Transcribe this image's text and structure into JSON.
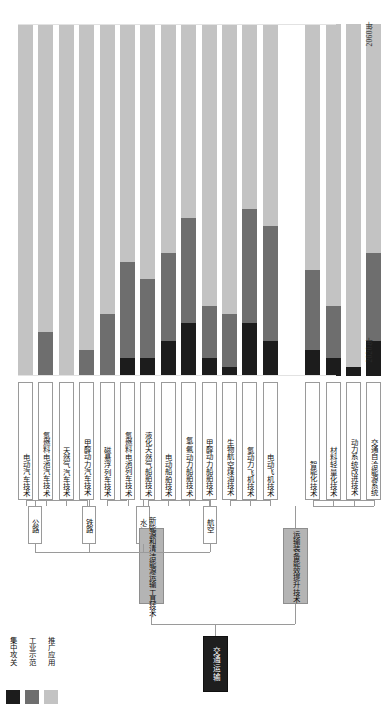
{
  "figure": {
    "years": {
      "top": "2060年",
      "bottom": "2020年"
    }
  },
  "legend": {
    "items": [
      {
        "label": "集中攻关",
        "color": "#1c1c1c"
      },
      {
        "label": "工业示范",
        "color": "#6e6e6e"
      },
      {
        "label": "推广应用",
        "color": "#c3c3c3"
      }
    ]
  },
  "hierarchy": {
    "root": {
      "label": "交通运输"
    },
    "groups": [
      {
        "label": "新能源和清洁能源运输工具技术"
      },
      {
        "label": "运输装备能效提升技术"
      }
    ],
    "categories": [
      {
        "label": "公路"
      },
      {
        "label": "铁路"
      },
      {
        "label": "水运"
      },
      {
        "label": "航空"
      }
    ]
  },
  "chart_data": {
    "type": "bar",
    "orientation": "vertical-stacked",
    "title": "",
    "xlabel": "",
    "ylabel": "",
    "ylim": [
      2020,
      2060
    ],
    "grid": false,
    "legend_position": "bottom-left",
    "series": [
      {
        "name": "集中攻关",
        "color": "#1c1c1c"
      },
      {
        "name": "工业示范",
        "color": "#6e6e6e"
      },
      {
        "name": "推广应用",
        "color": "#c3c3c3"
      }
    ],
    "categories": [
      "电动汽车技术",
      "氢燃料电池汽车技术",
      "天然气汽车技术",
      "甲醇动力汽车技术",
      "磁悬浮列车技术",
      "氢燃料电池列车技术",
      "液化天然气船舶技术",
      "电动船舶技术",
      "氢/氨动力船舶技术",
      "甲醇动力船舶技术",
      "生物航空煤油技术",
      "氢动力飞机技术",
      "电动飞机技术",
      "智能化技术",
      "材料轻量化技术",
      "动力系统改进技术",
      "交通自洽能源系统"
    ],
    "bars": [
      {
        "label": "电动汽车技术",
        "group": "公路",
        "focus_end": 2020,
        "demo_end": 2020,
        "deploy_end": 2060
      },
      {
        "label": "氢燃料电池汽车技术",
        "group": "公路",
        "focus_end": 2020,
        "demo_end": 2025,
        "deploy_end": 2060
      },
      {
        "label": "天然气汽车技术",
        "group": "公路",
        "focus_end": 2020,
        "demo_end": 2020,
        "deploy_end": 2060
      },
      {
        "label": "甲醇动力汽车技术",
        "group": "公路",
        "focus_end": 2020,
        "demo_end": 2023,
        "deploy_end": 2060
      },
      {
        "label": "磁悬浮列车技术",
        "group": "铁路",
        "focus_end": 2020,
        "demo_end": 2027,
        "deploy_end": 2060
      },
      {
        "label": "氢燃料电池列车技术",
        "group": "铁路",
        "focus_end": 2022,
        "demo_end": 2033,
        "deploy_end": 2060
      },
      {
        "label": "液化天然气船舶技术",
        "group": "水运",
        "focus_end": 2022,
        "demo_end": 2031,
        "deploy_end": 2060
      },
      {
        "label": "电动船舶技术",
        "group": "水运",
        "focus_end": 2024,
        "demo_end": 2034,
        "deploy_end": 2060
      },
      {
        "label": "氢/氨动力船舶技术",
        "group": "水运",
        "focus_end": 2026,
        "demo_end": 2038,
        "deploy_end": 2060
      },
      {
        "label": "甲醇动力船舶技术",
        "group": "水运",
        "focus_end": 2022,
        "demo_end": 2028,
        "deploy_end": 2060
      },
      {
        "label": "生物航空煤油技术",
        "group": "航空",
        "focus_end": 2021,
        "demo_end": 2027,
        "deploy_end": 2060
      },
      {
        "label": "氢动力飞机技术",
        "group": "航空",
        "focus_end": 2026,
        "demo_end": 2039,
        "deploy_end": 2060
      },
      {
        "label": "电动飞机技术",
        "group": "航空",
        "focus_end": 2024,
        "demo_end": 2037,
        "deploy_end": 2060
      },
      {
        "label": "智能化技术",
        "group": "效能",
        "focus_end": 2023,
        "demo_end": 2032,
        "deploy_end": 2060
      },
      {
        "label": "材料轻量化技术",
        "group": "效能",
        "focus_end": 2022,
        "demo_end": 2028,
        "deploy_end": 2060
      },
      {
        "label": "动力系统改进技术",
        "group": "效能",
        "focus_end": 2021,
        "demo_end": 2021,
        "deploy_end": 2060
      },
      {
        "label": "交通自洽能源系统",
        "group": "效能",
        "focus_end": 2024,
        "demo_end": 2034,
        "deploy_end": 2060
      }
    ]
  }
}
